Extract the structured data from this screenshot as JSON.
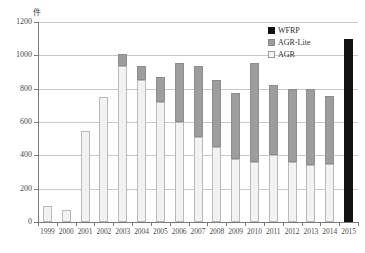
{
  "chart_data": {
    "type": "bar",
    "stacked": true,
    "title": "",
    "xlabel": "",
    "ylabel": "件",
    "unit_label": "件",
    "ylim": [
      0,
      1200
    ],
    "yticks": [
      0,
      200,
      400,
      600,
      800,
      1000,
      1200
    ],
    "grid": true,
    "legend_position": "top-right",
    "categories": [
      "1999",
      "2000",
      "2001",
      "2002",
      "2003",
      "2004",
      "2005",
      "2006",
      "2007",
      "2008",
      "2009",
      "2010",
      "2011",
      "2012",
      "2013",
      "2014",
      "2015"
    ],
    "series": [
      {
        "name": "AGR",
        "color": "#f2f2f2",
        "values": [
          95,
          70,
          545,
          750,
          935,
          850,
          720,
          600,
          510,
          450,
          380,
          360,
          400,
          360,
          345,
          350,
          0
        ]
      },
      {
        "name": "AGR-Lite",
        "color": "#9d9d9d",
        "values": [
          0,
          0,
          0,
          0,
          75,
          85,
          150,
          355,
          425,
          400,
          395,
          595,
          425,
          440,
          455,
          405,
          0
        ]
      },
      {
        "name": "WFRP",
        "color": "#121212",
        "values": [
          0,
          0,
          0,
          0,
          0,
          0,
          0,
          0,
          0,
          0,
          0,
          0,
          0,
          0,
          0,
          0,
          1100
        ]
      }
    ],
    "totals": [
      95,
      70,
      545,
      750,
      1010,
      935,
      870,
      955,
      935,
      850,
      775,
      955,
      825,
      800,
      800,
      755,
      1100
    ]
  },
  "legend": {
    "items": [
      {
        "label": "WFRP",
        "swatch": "wfrp-swatch"
      },
      {
        "label": "AGR-Lite",
        "swatch": "agr-lite-swatch"
      },
      {
        "label": "AGR",
        "swatch": "agr-swatch"
      }
    ]
  }
}
